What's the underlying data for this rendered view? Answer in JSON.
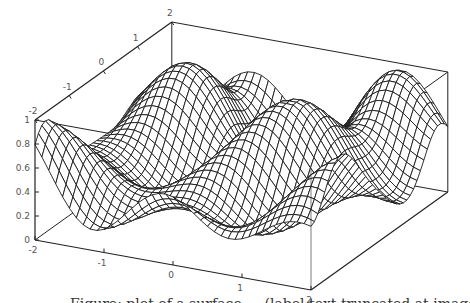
{
  "chart_data": {
    "type": "surface3d",
    "title": "",
    "xlabel": "",
    "ylabel": "",
    "zlabel": "",
    "x_range": [
      -2,
      2
    ],
    "y_range": [
      -2,
      2
    ],
    "z_range": [
      0,
      1
    ],
    "x_ticks": [
      {
        "value": -2,
        "label": "-2"
      },
      {
        "value": -1,
        "label": "-1"
      },
      {
        "value": 0,
        "label": "0"
      },
      {
        "value": 1,
        "label": "1"
      },
      {
        "value": 2,
        "label": "2"
      }
    ],
    "y_ticks": [
      {
        "value": -2,
        "label": "-2"
      },
      {
        "value": -1,
        "label": "-1"
      },
      {
        "value": 0,
        "label": "0"
      },
      {
        "value": 1,
        "label": "1"
      },
      {
        "value": 2,
        "label": "2"
      }
    ],
    "z_ticks": [
      {
        "value": 0,
        "label": "0"
      },
      {
        "value": 0.2,
        "label": "0.2"
      },
      {
        "value": 0.4,
        "label": "0.4"
      },
      {
        "value": 0.6,
        "label": "0.6"
      },
      {
        "value": 0.8,
        "label": "0.8"
      },
      {
        "value": 1,
        "label": "1"
      }
    ],
    "surface": "wireframe mesh, oscillating surface with values in [0,1] (approx. sin^2 of x*y-type pattern)",
    "mesh_resolution": 40,
    "boxed": true,
    "grid": false,
    "colors": {
      "mesh": "#1a1a1a",
      "box": "#222222",
      "fill": "#ffffff"
    }
  },
  "caption": {
    "text": "Figure: plot of a surface — (label text truncated at image edge)"
  }
}
